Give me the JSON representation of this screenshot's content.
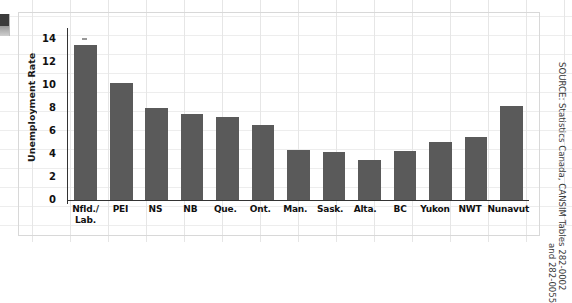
{
  "chart_data": {
    "type": "bar",
    "title": "",
    "xlabel": "",
    "ylabel": "Unemployment Rate",
    "ylim": [
      0,
      15
    ],
    "yticks": [
      0,
      2,
      4,
      6,
      8,
      10,
      12,
      14
    ],
    "grid": true,
    "legend": "none",
    "categories": [
      "Nfld./ Lab.",
      "PEI",
      "NS",
      "NB",
      "Que.",
      "Ont.",
      "Man.",
      "Sask.",
      "Alta.",
      "BC",
      "Yukon",
      "NWT",
      "Nunavut"
    ],
    "category_lines": [
      [
        "Nfld./",
        "Lab."
      ],
      [
        "PEI",
        ""
      ],
      [
        "NS",
        ""
      ],
      [
        "NB",
        ""
      ],
      [
        "Que.",
        ""
      ],
      [
        "Ont.",
        ""
      ],
      [
        "Man.",
        ""
      ],
      [
        "Sask.",
        ""
      ],
      [
        "Alta.",
        ""
      ],
      [
        "BC",
        ""
      ],
      [
        "Yukon",
        ""
      ],
      [
        "NWT",
        ""
      ],
      [
        "Nunavut",
        ""
      ]
    ],
    "values": [
      13.5,
      10.2,
      8.0,
      7.5,
      7.2,
      6.5,
      4.4,
      4.2,
      3.5,
      4.25,
      5.1,
      5.5,
      8.2
    ],
    "bar_color": "#5a5a5a",
    "axis_color": "#333333"
  },
  "source": {
    "line1": "SOURCE: Statistics Canada, CANSIM Tables 282-0002",
    "line2": "and 282-0055"
  }
}
